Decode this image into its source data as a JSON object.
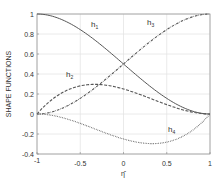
{
  "chart_data": {
    "type": "line",
    "title": "",
    "xlabel": "η̂",
    "ylabel": "SHAPE FUNCTIONS",
    "xlim": [
      -1,
      1
    ],
    "ylim": [
      -0.4,
      1
    ],
    "grid": true,
    "legend": "inline curve labels",
    "x_ticks": [
      -1,
      -0.5,
      0,
      0.5,
      1
    ],
    "x_tick_labels": [
      "-1",
      "-0.5",
      "0",
      "0.5",
      "1"
    ],
    "y_ticks": [
      -0.4,
      -0.2,
      0,
      0.2,
      0.4,
      0.6,
      0.8,
      1
    ],
    "y_tick_labels": [
      "-0.4",
      "-0.2",
      "0",
      "0.2",
      "0.4",
      "0.6",
      "0.8",
      "1"
    ],
    "x": [
      -1,
      -0.75,
      -0.5,
      -0.25,
      0,
      0.25,
      0.5,
      0.75,
      1
    ],
    "series": [
      {
        "name": "h1",
        "label_main": "h",
        "label_sub": "1",
        "style": "solid",
        "values": [
          1.0,
          0.984,
          0.844,
          0.615,
          0.5,
          0.203,
          0.156,
          0.016,
          0.0
        ]
      },
      {
        "name": "h2",
        "label_main": "h",
        "label_sub": "2",
        "style": "dashed",
        "values": [
          0.0,
          0.191,
          0.281,
          0.293,
          0.25,
          0.176,
          0.094,
          0.027,
          0.0
        ]
      },
      {
        "name": "h3",
        "label_main": "h",
        "label_sub": "3",
        "style": "dashdot",
        "values": [
          0.0,
          0.016,
          0.156,
          0.385,
          0.5,
          0.797,
          0.844,
          0.984,
          1.0
        ]
      },
      {
        "name": "h4",
        "label_main": "h",
        "label_sub": "4",
        "style": "dotted",
        "values": [
          0.0,
          -0.027,
          -0.094,
          -0.176,
          -0.25,
          -0.293,
          -0.281,
          -0.191,
          0.0
        ]
      }
    ],
    "label_positions": {
      "h1": [
        91,
        27
      ],
      "h2": [
        66,
        77
      ],
      "h3": [
        147,
        25
      ],
      "h4": [
        168,
        132
      ]
    }
  }
}
